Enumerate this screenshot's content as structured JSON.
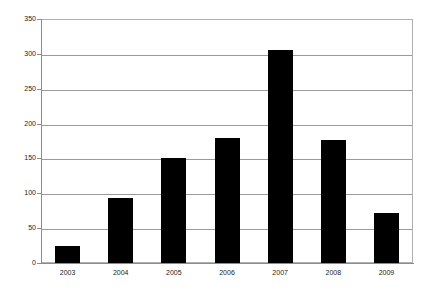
{
  "chart_data": {
    "type": "bar",
    "title": "",
    "subtitle": "",
    "xlabel": "",
    "ylabel": "",
    "categories": [
      "2003",
      "2004",
      "2005",
      "2006",
      "2007",
      "2008",
      "2009"
    ],
    "values": [
      25,
      93,
      150,
      179,
      306,
      176,
      72
    ],
    "series": [
      {
        "name": "",
        "values": [
          25,
          93,
          150,
          179,
          306,
          176,
          72
        ]
      }
    ],
    "ylim": [
      0,
      350
    ],
    "y_ticks": [
      0,
      50,
      100,
      150,
      200,
      250,
      300,
      350
    ],
    "y_tick_labels": [
      "0",
      "50",
      "100",
      "150",
      "200",
      "250",
      "300",
      "350"
    ],
    "grid": "horizontal",
    "legend": "none",
    "bar_color": "#000000",
    "grid_color": "#9a9a9a",
    "axis_color": "#8c8c8c",
    "frame_color": "#b0b0b0",
    "background": "#ffffff",
    "annotations": []
  }
}
